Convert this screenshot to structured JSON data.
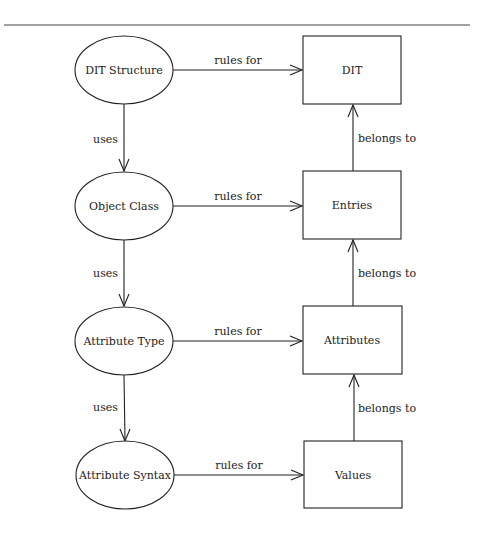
{
  "diagram": {
    "type": "concept-map",
    "rule_line": {
      "x1": 4,
      "x2": 470,
      "y": 25
    },
    "colors": {
      "stroke": "#222222",
      "text": "#222222",
      "background": "#ffffff"
    },
    "ellipses": [
      {
        "id": "dit-structure",
        "label": "DIT Structure",
        "cx": 124,
        "cy": 70,
        "rx": 49,
        "ry": 34
      },
      {
        "id": "object-class",
        "label": "Object Class",
        "cx": 124,
        "cy": 206,
        "rx": 49,
        "ry": 34
      },
      {
        "id": "attribute-type",
        "label": "Attribute Type",
        "cx": 124,
        "cy": 341,
        "rx": 49,
        "ry": 34
      },
      {
        "id": "attribute-syntax",
        "label": "Attribute Syntax",
        "cx": 125,
        "cy": 475,
        "rx": 49,
        "ry": 34
      }
    ],
    "boxes": [
      {
        "id": "dit",
        "label": "DIT",
        "x": 303,
        "y": 36,
        "w": 98,
        "h": 68
      },
      {
        "id": "entries",
        "label": "Entries",
        "x": 303,
        "y": 171,
        "w": 98,
        "h": 68
      },
      {
        "id": "attributes",
        "label": "Attributes",
        "x": 303,
        "y": 306,
        "w": 98,
        "h": 68
      },
      {
        "id": "values",
        "label": "Values",
        "x": 304,
        "y": 441,
        "w": 98,
        "h": 67
      }
    ],
    "edges": {
      "rules_for": [
        {
          "from": "dit-structure",
          "to": "dit",
          "label": "rules for"
        },
        {
          "from": "object-class",
          "to": "entries",
          "label": "rules for"
        },
        {
          "from": "attribute-type",
          "to": "attributes",
          "label": "rules for"
        },
        {
          "from": "attribute-syntax",
          "to": "values",
          "label": "rules for"
        }
      ],
      "uses": [
        {
          "from": "dit-structure",
          "to": "object-class",
          "label": "uses"
        },
        {
          "from": "object-class",
          "to": "attribute-type",
          "label": "uses"
        },
        {
          "from": "attribute-type",
          "to": "attribute-syntax",
          "label": "uses"
        }
      ],
      "belongs_to": [
        {
          "from": "entries",
          "to": "dit",
          "label": "belongs to"
        },
        {
          "from": "attributes",
          "to": "entries",
          "label": "belongs to"
        },
        {
          "from": "values",
          "to": "attributes",
          "label": "belongs to"
        }
      ]
    }
  }
}
